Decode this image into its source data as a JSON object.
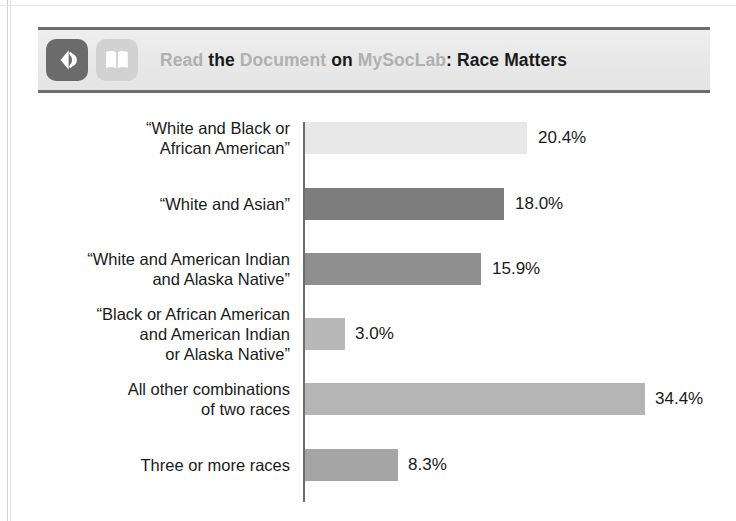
{
  "banner": {
    "icons": [
      {
        "name": "listen-icon",
        "semantic": "audio-waves-icon"
      },
      {
        "name": "read-document-icon",
        "semantic": "open-book-icon"
      }
    ],
    "title_parts": [
      {
        "text": "Read",
        "style": "muted"
      },
      {
        "text": "the",
        "style": "dark"
      },
      {
        "text": "Document",
        "style": "muted"
      },
      {
        "text": "on",
        "style": "dark"
      },
      {
        "text": "MySocLab",
        "style": "muted",
        "tight": true
      },
      {
        "text": ": Race Matters",
        "style": "dark"
      }
    ],
    "title_plain": "Read the Document on MySocLab: Race Matters",
    "colors": {
      "banner_background": "#e9e9e9",
      "rule": "#6e6e6e",
      "muted_text": "#b0b0b0",
      "dark_text": "#1b1b1b",
      "listen_icon_background": "#6b6b6b",
      "book_icon_background": "#d2d2d2"
    }
  },
  "chart_data": {
    "type": "bar",
    "orientation": "horizontal",
    "title": "",
    "xlabel": "",
    "ylabel": "",
    "grid": false,
    "legend": false,
    "value_suffix": "%",
    "categories": [
      "“White and Black or\nAfrican American”",
      "“White and Asian”",
      "“White and American Indian\nand Alaska Native”",
      "“Black or African American\nand American Indian\nor Alaska Native”",
      "All other combinations\nof two races",
      "Three or more races"
    ],
    "values": [
      20.4,
      18.0,
      15.9,
      3.0,
      34.4,
      8.3
    ],
    "value_labels": [
      "20.4%",
      "18.0%",
      "15.9%",
      "3.0%",
      "34.4%",
      "8.3%"
    ],
    "bar_colors": [
      "#e8e8e8",
      "#7d7d7d",
      "#8f8f8f",
      "#b8b8b8",
      "#b5b5b5",
      "#a5a5a5"
    ],
    "axis_color": "#6d6d6d",
    "xlim": [
      0,
      34.4
    ]
  },
  "geometry": {
    "rows": [
      {
        "top": 12,
        "bar_width": 222,
        "label_top": 8,
        "value_left": 538
      },
      {
        "top": 78,
        "bar_width": 199,
        "label_top": 84,
        "value_left": 515
      },
      {
        "top": 143,
        "bar_width": 176,
        "label_top": 139,
        "value_left": 492
      },
      {
        "top": 208,
        "bar_width": 40,
        "label_top": 194,
        "value_left": 355
      },
      {
        "top": 273,
        "bar_width": 340,
        "label_top": 269,
        "value_left": 655
      },
      {
        "top": 339,
        "bar_width": 93,
        "label_top": 345,
        "value_left": 408
      }
    ]
  }
}
